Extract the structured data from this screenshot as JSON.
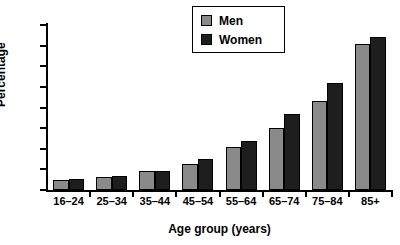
{
  "chart_data": {
    "type": "bar",
    "title": "",
    "xlabel": "Age group (years)",
    "ylabel": "Percentage",
    "categories": [
      "16–24",
      "25–34",
      "35–44",
      "45–54",
      "55–64",
      "65–74",
      "75–84",
      "85+"
    ],
    "series": [
      {
        "name": "Men",
        "color": "#8a8a8a",
        "values": [
          5,
          6.5,
          9,
          12.5,
          21,
          30,
          43,
          71
        ]
      },
      {
        "name": "Women",
        "color": "#1e1e1e",
        "values": [
          5.5,
          7,
          9,
          15,
          24,
          37,
          52,
          74
        ]
      }
    ],
    "ylim": [
      0,
      80
    ],
    "yticks": [
      0,
      10,
      20,
      30,
      40,
      50,
      60,
      70,
      80
    ],
    "ytick_labels": [
      "0",
      "10",
      "20",
      "30",
      "40",
      "50",
      "60",
      "70",
      "80"
    ],
    "grid": false,
    "legend_position": "top-center"
  },
  "legend": {
    "entries": [
      {
        "label": "Men",
        "swatch": "men-swatch"
      },
      {
        "label": "Women",
        "swatch": "women-swatch"
      }
    ]
  },
  "axes": {
    "y_title": "Percentage",
    "x_title": "Age group (years)"
  }
}
